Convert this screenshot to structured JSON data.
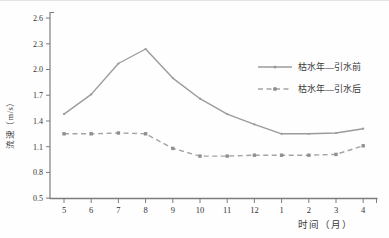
{
  "figure": {
    "ylabel": "流速（m/s）",
    "xlabel": "时间（月）"
  },
  "chart_data": {
    "type": "line",
    "title": "",
    "xlabel": "时间（月）",
    "ylabel": "流速（m/s）",
    "x_categories": [
      "5",
      "6",
      "7",
      "8",
      "9",
      "10",
      "11",
      "12",
      "1",
      "2",
      "3",
      "4"
    ],
    "ylim": [
      0.5,
      2.6
    ],
    "ytick_step": 0.3,
    "ytick_labels": [
      "0.5",
      "0.8",
      "1.1",
      "1.4",
      "1.7",
      "2.0",
      "2.3",
      "2.6"
    ],
    "grid": false,
    "legend_position": "inside-top-right",
    "series": [
      {
        "name": "枯水年—引水前",
        "line_style": "solid",
        "marker": "dot",
        "color": "#9b9b9b",
        "marker_color": "#9b9b9b",
        "values": [
          1.48,
          1.71,
          2.07,
          2.24,
          1.9,
          1.66,
          1.48,
          1.36,
          1.25,
          1.25,
          1.26,
          1.31
        ]
      },
      {
        "name": "枯水年—引水后",
        "line_style": "dashed",
        "marker": "square",
        "color": "#a4a4a4",
        "marker_color": "#8f8f8f",
        "values": [
          1.25,
          1.25,
          1.26,
          1.25,
          1.08,
          0.99,
          0.99,
          1.0,
          1.0,
          1.0,
          1.01,
          1.11
        ]
      }
    ],
    "axis_color": "#7d7d7d",
    "text_color": "#333333"
  }
}
